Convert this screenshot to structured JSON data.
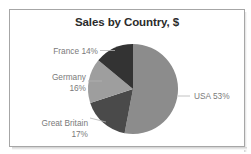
{
  "chart_data": {
    "type": "pie",
    "title": "Sales by Country, $",
    "categories": [
      "USA",
      "Great Britain",
      "Germany",
      "France"
    ],
    "values": [
      53,
      17,
      16,
      14
    ],
    "unit": "%",
    "labels": [
      {
        "name": "USA",
        "text": "USA 53%",
        "percent": 53,
        "color": "#8c8c8c",
        "position": "right"
      },
      {
        "name": "Great Britain",
        "text": "Great Britain\n17%",
        "percent": 17,
        "color": "#4a4a4a",
        "position": "bottom-left"
      },
      {
        "name": "Germany",
        "text": "Germany\n16%",
        "percent": 16,
        "color": "#9e9e9e",
        "position": "left"
      },
      {
        "name": "France",
        "text": "France 14%",
        "percent": 14,
        "color": "#333333",
        "position": "top-left"
      }
    ],
    "legend": "none",
    "grid": false,
    "xlabel": "",
    "ylabel": "",
    "start_angle_deg": 0,
    "direction": "clockwise",
    "colors": {
      "usa": "#8c8c8c",
      "great_britain": "#4a4a4a",
      "germany": "#9e9e9e",
      "france": "#333333",
      "border": "#a6a6a6",
      "label_text": "#7a7a7a",
      "title_text": "#2b2b2b",
      "leader_line": "#b3b3b3",
      "background": "#ffffff"
    }
  }
}
